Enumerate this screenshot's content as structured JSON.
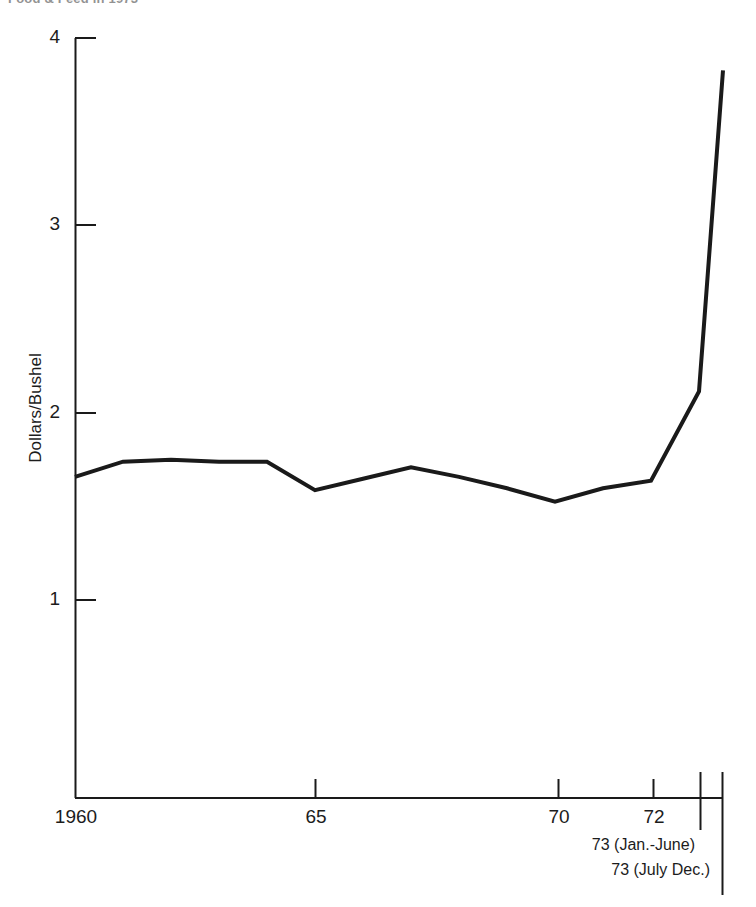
{
  "chart_data": {
    "type": "line",
    "title": "Food & Feed in 1973",
    "xlabel": "",
    "ylabel": "Dollars/Bushel",
    "ylim": [
      0,
      4
    ],
    "xlim": [
      1960,
      1973.5
    ],
    "grid": false,
    "legend": null,
    "y_ticks": [
      1,
      2,
      3,
      4
    ],
    "y_tick_labels": [
      "1",
      "2",
      "3",
      "4"
    ],
    "x_ticks": [
      1960,
      1965,
      1970,
      1972,
      1973.0,
      1973.5
    ],
    "x_tick_labels": [
      "1960",
      "65",
      "70",
      "72",
      "",
      ""
    ],
    "x_labeled_ticks": [
      {
        "value": 1960,
        "label": "1960"
      },
      {
        "value": 1965,
        "label": "65"
      },
      {
        "value": 1970,
        "label": "70"
      },
      {
        "value": 1972,
        "label": "72"
      }
    ],
    "annotations": [
      {
        "id": "period-1",
        "text": "73 (Jan.-June)"
      },
      {
        "id": "period-2",
        "text": "73 (July  Dec.)"
      }
    ],
    "x": [
      1960,
      1961,
      1962,
      1963,
      1964,
      1965,
      1966,
      1967,
      1968,
      1969,
      1970,
      1971,
      1972,
      1973.0,
      1973.5
    ],
    "values": [
      1.69,
      1.77,
      1.78,
      1.77,
      1.77,
      1.62,
      1.68,
      1.74,
      1.69,
      1.63,
      1.56,
      1.63,
      1.67,
      2.14,
      3.83
    ],
    "series": [
      {
        "name": "Wheat price",
        "values": [
          1.69,
          1.77,
          1.78,
          1.77,
          1.77,
          1.62,
          1.68,
          1.74,
          1.69,
          1.63,
          1.56,
          1.63,
          1.67,
          2.14,
          3.83
        ]
      }
    ],
    "line_color": "#1a1a1a",
    "axis_color": "#1a1a1a"
  },
  "axis": {
    "y_title": "Dollars/Bushel",
    "y_labels": {
      "t4": "4",
      "t3": "3",
      "t2": "2",
      "t1": "1"
    },
    "x_labels": {
      "x1960": "1960",
      "x65": "65",
      "x70": "70",
      "x72": "72"
    }
  },
  "notes": {
    "jan_june": "73 (Jan.-June)",
    "july_dec": "73 (July  Dec.)"
  },
  "header": {
    "title": "Food & Feed in 1973"
  }
}
